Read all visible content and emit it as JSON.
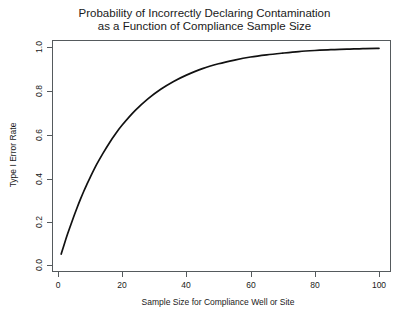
{
  "chart_data": {
    "type": "line",
    "title": "Probability of Incorrectly Declaring Contamination as a Function of Compliance Sample Size",
    "title_line1": "Probability of Incorrectly Declaring Contamination",
    "title_line2": "as a Function of Compliance Sample Size",
    "xlabel": "Sample Size for Compliance Well or Site",
    "ylabel": "Type I Error Rate",
    "xlim": [
      0,
      104
    ],
    "ylim": [
      0,
      1.04
    ],
    "grid": false,
    "legend": null,
    "x_ticks": [
      0,
      20,
      40,
      60,
      80,
      100
    ],
    "x_tick_labels": [
      "0",
      "20",
      "40",
      "60",
      "80",
      "100"
    ],
    "y_ticks": [
      0.0,
      0.2,
      0.4,
      0.6,
      0.8,
      1.0
    ],
    "y_tick_labels": [
      "0.0",
      "0.2",
      "0.4",
      "0.6",
      "0.8",
      "1.0"
    ],
    "series": [
      {
        "name": "Type I Error Rate",
        "color": "#111111",
        "x": [
          1,
          2,
          3,
          4,
          5,
          6,
          7,
          8,
          9,
          10,
          12,
          14,
          16,
          18,
          20,
          24,
          28,
          32,
          36,
          40,
          45,
          50,
          55,
          60,
          65,
          70,
          75,
          80,
          85,
          90,
          95,
          100
        ],
        "y": [
          0.05,
          0.098,
          0.143,
          0.185,
          0.226,
          0.265,
          0.302,
          0.337,
          0.37,
          0.401,
          0.46,
          0.512,
          0.56,
          0.603,
          0.642,
          0.708,
          0.762,
          0.806,
          0.842,
          0.871,
          0.901,
          0.923,
          0.94,
          0.954,
          0.964,
          0.972,
          0.979,
          0.984,
          0.988,
          0.99,
          0.993,
          0.994
        ]
      }
    ]
  }
}
